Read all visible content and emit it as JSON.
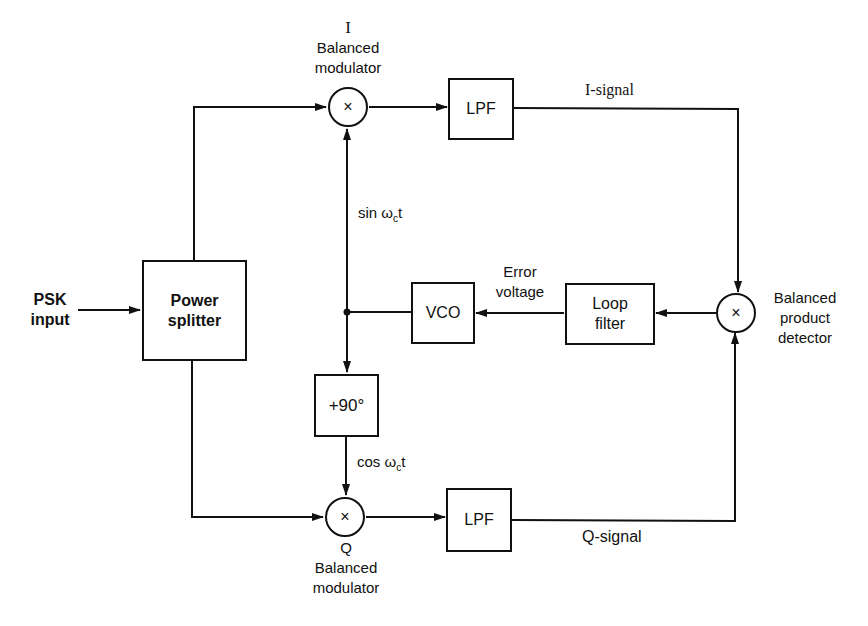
{
  "diagram": {
    "input": {
      "line1": "PSK",
      "line2": "input"
    },
    "power_splitter": {
      "line1": "Power",
      "line2": "splitter"
    },
    "i_modulator": {
      "title": "I",
      "line1": "Balanced",
      "line2": "modulator",
      "symbol": "×"
    },
    "q_modulator": {
      "title": "Q",
      "line1": "Balanced",
      "line2": "modulator",
      "symbol": "×"
    },
    "lpf_top": {
      "label": "LPF"
    },
    "lpf_bottom": {
      "label": "LPF"
    },
    "i_signal": "I-signal",
    "q_signal": "Q-signal",
    "product_detector": {
      "line1": "Balanced",
      "line2": "product",
      "line3": "detector",
      "symbol": "×"
    },
    "loop_filter": {
      "line1": "Loop",
      "line2": "filter"
    },
    "error_voltage": {
      "line1": "Error",
      "line2": "voltage"
    },
    "vco": {
      "label": "VCO"
    },
    "phase_shift": {
      "label": "+90°"
    },
    "sin_label": {
      "prefix": "sin ω",
      "sub": "c",
      "suffix": "t"
    },
    "cos_label": {
      "prefix": "cos ω",
      "sub": "c",
      "suffix": "t"
    }
  },
  "colors": {
    "line": "#111111",
    "background": "#ffffff"
  }
}
